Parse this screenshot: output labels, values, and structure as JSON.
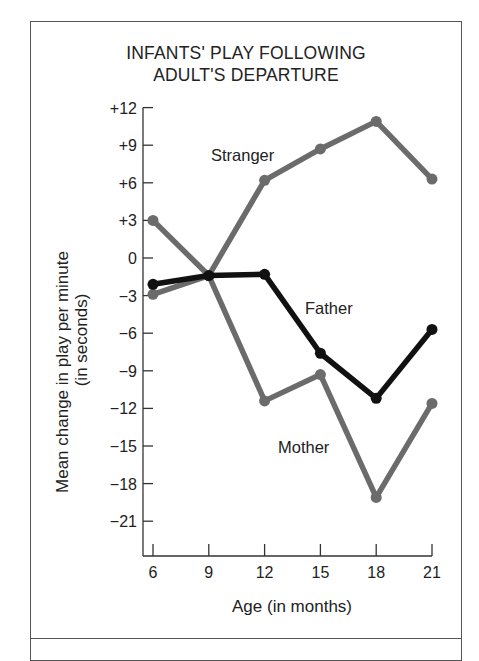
{
  "chart_data": {
    "type": "line",
    "title_lines": [
      "INFANTS' PLAY FOLLOWING",
      "ADULT'S DEPARTURE"
    ],
    "xlabel": "Age (in months)",
    "ylabel": "Mean change in play per minute",
    "ylabel_sub": "(in seconds)",
    "x": [
      6,
      9,
      12,
      15,
      18,
      21
    ],
    "x_tick_labels": [
      "6",
      "9",
      "12",
      "15",
      "18",
      "21"
    ],
    "y_tick_labels": [
      "+12",
      "+9",
      "+6",
      "+3",
      "0",
      "−3",
      "−6",
      "−9",
      "−12",
      "−15",
      "−18",
      "−21"
    ],
    "y_ticks": [
      12,
      9,
      6,
      3,
      0,
      -3,
      -6,
      -9,
      -12,
      -15,
      -18,
      -21
    ],
    "ylim": [
      -24,
      12
    ],
    "xlim": [
      5.5,
      21
    ],
    "grid": false,
    "legend": "inline labels",
    "series": [
      {
        "name": "Stranger",
        "color": "#6b6b6b",
        "values": [
          -2.9,
          -1.4,
          6.2,
          8.7,
          10.9,
          6.3
        ]
      },
      {
        "name": "Father",
        "color": "#111111",
        "values": [
          -2.1,
          -1.4,
          -1.3,
          -7.6,
          -11.2,
          -5.7
        ]
      },
      {
        "name": "Mother",
        "color": "#6b6b6b",
        "values": [
          3.0,
          -1.4,
          -11.4,
          -9.3,
          -19.1,
          -11.6
        ]
      }
    ]
  }
}
